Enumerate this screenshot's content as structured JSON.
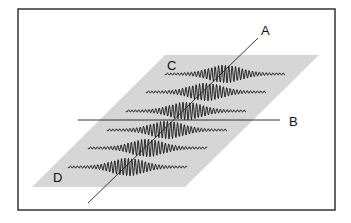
{
  "figure": {
    "frame": {
      "x": 18,
      "y": 9,
      "width": 317,
      "height": 201,
      "stroke": "#333333"
    },
    "plane": {
      "points": [
        [
          165,
          55
        ],
        [
          319,
          55
        ],
        [
          185,
          187
        ],
        [
          32,
          187
        ]
      ],
      "fill": "#d6d6d6"
    },
    "waves": {
      "rows": [
        {
          "y": 74,
          "x_start": 165,
          "x_end": 285,
          "center": 225
        },
        {
          "y": 92,
          "x_start": 146,
          "x_end": 266,
          "center": 206
        },
        {
          "y": 111,
          "x_start": 126,
          "x_end": 246,
          "center": 186
        },
        {
          "y": 130,
          "x_start": 107,
          "x_end": 227,
          "center": 167
        },
        {
          "y": 148,
          "x_start": 88,
          "x_end": 207,
          "center": 147
        },
        {
          "y": 167,
          "x_start": 68,
          "x_end": 187,
          "center": 128
        }
      ],
      "amplitude": 9,
      "wavelength": 3.4,
      "stroke": "#111111"
    },
    "lines": {
      "A": {
        "x1": 258,
        "y1": 38,
        "x2": 88,
        "y2": 203
      },
      "B": {
        "x1": 78,
        "y1": 120,
        "x2": 280,
        "y2": 120
      }
    },
    "labels": [
      {
        "id": "A",
        "text": "A",
        "x": 261,
        "y": 35
      },
      {
        "id": "B",
        "text": "B",
        "x": 289,
        "y": 126
      },
      {
        "id": "C",
        "text": "C",
        "x": 167,
        "y": 70
      },
      {
        "id": "D",
        "text": "D",
        "x": 53,
        "y": 182
      }
    ]
  }
}
